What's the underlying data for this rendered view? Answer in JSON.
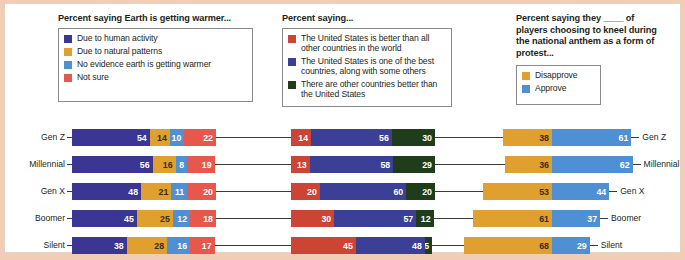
{
  "background_color": "#f0cdb4",
  "panel_color": "#ffffff",
  "colors": {
    "purple": "#4a3f96",
    "orange": "#e0a030",
    "light_blue": "#4f8fd4",
    "red_salmon": "#e8574c",
    "red_dark": "#cc4433",
    "blue_dark": "#3b3f96",
    "green_dark": "#1f3d1a",
    "tick": "#3a3a3a",
    "legend_border": "#8b8b8b",
    "text": "#231f20"
  },
  "legends": [
    {
      "title": "Percent saying Earth is getting warmer...",
      "items": [
        {
          "label": "Due to human activity",
          "color": "#3b3594"
        },
        {
          "label": "Due to natural patterns",
          "color": "#e0a030"
        },
        {
          "label": "No evidence earth is getting warmer",
          "color": "#4f8fd4"
        },
        {
          "label": "Not sure",
          "color": "#e8574c"
        }
      ]
    },
    {
      "title": "Percent saying...",
      "items": [
        {
          "label": "The United States is better than all other countries in the world",
          "color": "#cc4433"
        },
        {
          "label": "The United States is one of the best countries, along with some others",
          "color": "#3b3f96"
        },
        {
          "label": "There are other countries better than the United States",
          "color": "#1f3d1a"
        }
      ]
    },
    {
      "title": "Percent saying they ____ of players choosing to kneel during the national anthem as a form of protest...",
      "items": [
        {
          "label": "Disapprove",
          "color": "#e0a030"
        },
        {
          "label": "Approve",
          "color": "#4f8fd4"
        }
      ]
    }
  ],
  "row_labels_left": [
    "Gen Z",
    "Millennial",
    "Gen X",
    "Boomer",
    "Silent"
  ],
  "row_labels_right": [
    "Gen Z",
    "Millennial",
    "Gen X",
    "Boomer",
    "Silent"
  ],
  "chart_data": [
    {
      "type": "bar",
      "orientation": "horizontal",
      "stacked": true,
      "title": "Percent saying Earth is getting warmer...",
      "xlabel": "",
      "ylabel": "",
      "categories": [
        "Gen Z",
        "Millennial",
        "Gen X",
        "Boomer",
        "Silent"
      ],
      "series": [
        {
          "name": "Due to human activity",
          "color": "#3b3594",
          "values": [
            54,
            56,
            48,
            45,
            38
          ]
        },
        {
          "name": "Due to natural patterns",
          "color": "#e0a030",
          "values": [
            14,
            16,
            21,
            25,
            28
          ]
        },
        {
          "name": "No evidence earth is getting warmer",
          "color": "#4f8fd4",
          "values": [
            10,
            8,
            11,
            12,
            16
          ]
        },
        {
          "name": "Not sure",
          "color": "#e8574c",
          "values": [
            22,
            19,
            20,
            18,
            17
          ]
        }
      ],
      "legend_position": "top-left",
      "grid": false
    },
    {
      "type": "bar",
      "orientation": "horizontal",
      "stacked": true,
      "title": "Percent saying...",
      "xlabel": "",
      "ylabel": "",
      "categories": [
        "Gen Z",
        "Millennial",
        "Gen X",
        "Boomer",
        "Silent"
      ],
      "series": [
        {
          "name": "The United States is better than all other countries in the world",
          "color": "#cc4433",
          "values": [
            14,
            13,
            20,
            30,
            45
          ]
        },
        {
          "name": "The United States is one of the best countries, along with some others",
          "color": "#3b3f96",
          "values": [
            56,
            58,
            60,
            57,
            48
          ]
        },
        {
          "name": "There are other countries better than the United States",
          "color": "#1f3d1a",
          "values": [
            30,
            29,
            20,
            12,
            5
          ]
        }
      ],
      "legend_position": "top-center",
      "grid": false
    },
    {
      "type": "bar",
      "orientation": "horizontal",
      "stacked": true,
      "diverging": true,
      "title": "Percent saying they ____ of players choosing to kneel during the national anthem as a form of protest...",
      "xlabel": "",
      "ylabel": "",
      "categories": [
        "Gen Z",
        "Millennial",
        "Gen X",
        "Boomer",
        "Silent"
      ],
      "series": [
        {
          "name": "Disapprove",
          "color": "#e0a030",
          "values": [
            38,
            36,
            53,
            61,
            68
          ]
        },
        {
          "name": "Approve",
          "color": "#4f8fd4",
          "values": [
            61,
            62,
            44,
            37,
            29
          ]
        }
      ],
      "legend_position": "top-right",
      "grid": false
    }
  ]
}
